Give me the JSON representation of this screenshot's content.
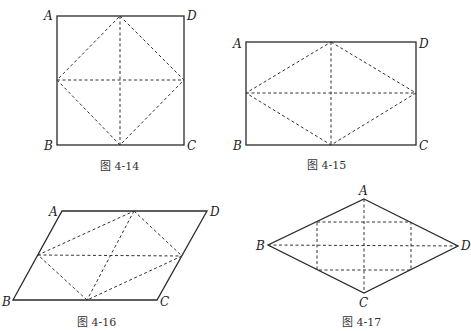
{
  "figures": [
    {
      "id": "fig-4-14",
      "caption": "图 4-14",
      "shape": "square",
      "labels": {
        "A": "A",
        "B": "B",
        "C": "C",
        "D": "D"
      }
    },
    {
      "id": "fig-4-15",
      "caption": "图 4-15",
      "shape": "rectangle",
      "labels": {
        "A": "A",
        "B": "B",
        "C": "C",
        "D": "D"
      }
    },
    {
      "id": "fig-4-16",
      "caption": "图 4-16",
      "shape": "parallelogram",
      "labels": {
        "A": "A",
        "B": "B",
        "C": "C",
        "D": "D"
      }
    },
    {
      "id": "fig-4-17",
      "caption": "图 4-17",
      "shape": "rhombus",
      "labels": {
        "A": "A",
        "B": "B",
        "C": "C",
        "D": "D"
      }
    }
  ]
}
